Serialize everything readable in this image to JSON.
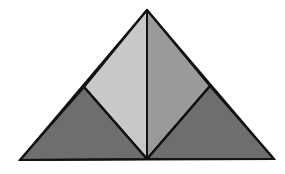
{
  "diagram": {
    "type": "triangle-dissection",
    "background": "#ffffff",
    "stroke_color": "#111111",
    "stroke_width": 2,
    "vertices": {
      "apex": [
        147,
        10
      ],
      "bottom_left": [
        20,
        160
      ],
      "bottom_right": [
        274,
        159
      ],
      "left_mid": [
        84,
        87
      ],
      "right_mid": [
        210,
        86
      ],
      "bottom_center": [
        147,
        159
      ]
    },
    "regions": [
      {
        "name": "upper-left-quadrilateral",
        "points": "147,10 147,159 84,87",
        "fill": "#c8c8c8"
      },
      {
        "name": "upper-right-quadrilateral",
        "points": "147,10 210,86 147,159",
        "fill": "#9a9a9a"
      },
      {
        "name": "lower-left-triangle",
        "points": "20,160 84,87 147,159",
        "fill": "#6e6e6e"
      },
      {
        "name": "lower-right-triangle",
        "points": "147,159 210,86 274,159",
        "fill": "#6e6e6e"
      }
    ]
  }
}
